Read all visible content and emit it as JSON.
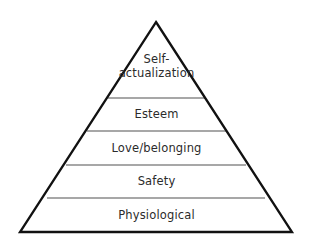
{
  "diagram": {
    "name": "maslow-hierarchy-of-needs-pyramid",
    "type": "pyramid",
    "background_color": "#ffffff",
    "outline_color": "#111111",
    "divider_color": "#8a8a8a",
    "text_color": "#2b2b2b",
    "apex": {
      "x": 156,
      "y": 22
    },
    "base_left": {
      "x": 20,
      "y": 232
    },
    "base_right": {
      "x": 292,
      "y": 232
    },
    "tiers": [
      {
        "id": "self-actualization",
        "label": "Self-\nactualization",
        "level": 5,
        "position_from_top": 1,
        "divider_y": 98,
        "divider_x_start": 108,
        "divider_x_end": 205
      },
      {
        "id": "esteem",
        "label": "Esteem",
        "level": 4,
        "position_from_top": 2,
        "divider_y": 131,
        "divider_x_start": 87,
        "divider_x_end": 226
      },
      {
        "id": "love-belonging",
        "label": "Love/belonging",
        "level": 3,
        "position_from_top": 3,
        "divider_y": 165,
        "divider_x_start": 66,
        "divider_x_end": 246
      },
      {
        "id": "safety",
        "label": "Safety",
        "level": 2,
        "position_from_top": 4,
        "divider_y": 198,
        "divider_x_start": 47,
        "divider_x_end": 265
      },
      {
        "id": "physiological",
        "label": "Physiological",
        "level": 1,
        "position_from_top": 5,
        "divider_y": 232,
        "divider_x_start": 20,
        "divider_x_end": 292
      }
    ]
  }
}
